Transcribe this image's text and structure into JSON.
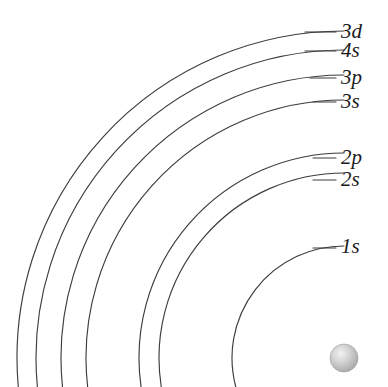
{
  "figure": {
    "background_color": "#ffffff",
    "line_color": "#3c3c3c",
    "label_color": "#1a1a1a",
    "width": 388,
    "height": 387,
    "partial_caption_top": ""
  },
  "nucleus": {
    "name": "nucleus",
    "center_x": 344,
    "center_y": 358,
    "radius": 14,
    "fill_color": "#b4b4b4",
    "highlight_color": "#e8e8e8"
  },
  "shells": [
    {
      "label": "3d",
      "n": 3,
      "subshell": "d",
      "radius": 327,
      "arc_end_y": 32,
      "label_y": 21,
      "leader_x1": 305,
      "leader_x2": 336
    },
    {
      "label": "4s",
      "n": 4,
      "subshell": "s",
      "radius": 308,
      "arc_end_y": 51,
      "label_y": 40,
      "leader_x1": 305,
      "leader_x2": 336
    },
    {
      "label": "3p",
      "n": 3,
      "subshell": "p",
      "radius": 283,
      "arc_end_y": 78,
      "label_y": 67,
      "leader_x1": 310,
      "leader_x2": 336
    },
    {
      "label": "3s",
      "n": 3,
      "subshell": "s",
      "radius": 258,
      "arc_end_y": 102,
      "label_y": 91,
      "leader_x1": 313,
      "leader_x2": 336
    },
    {
      "label": "2p",
      "n": 2,
      "subshell": "p",
      "radius": 205,
      "arc_end_y": 158,
      "label_y": 147,
      "leader_x1": 313,
      "leader_x2": 336
    },
    {
      "label": "2s",
      "n": 2,
      "subshell": "s",
      "radius": 185,
      "arc_end_y": 180,
      "label_y": 169,
      "leader_x1": 313,
      "leader_x2": 336
    },
    {
      "label": "1s",
      "n": 1,
      "subshell": "s",
      "radius": 112,
      "arc_end_y": 248,
      "label_y": 236,
      "leader_x1": 313,
      "leader_x2": 336
    }
  ],
  "chart_data": {
    "type": "diagram",
    "categories": [
      "1s",
      "2s",
      "2p",
      "3s",
      "3p",
      "4s",
      "3d"
    ],
    "values": [
      112,
      185,
      205,
      258,
      283,
      308,
      327
    ],
    "xlabel": "orbital",
    "ylabel": "shell radius (px from nucleus)",
    "note": "Concentric quarter-arcs drawn about a nucleus at the lower-right; each arc is labelled with its orbital designation."
  }
}
